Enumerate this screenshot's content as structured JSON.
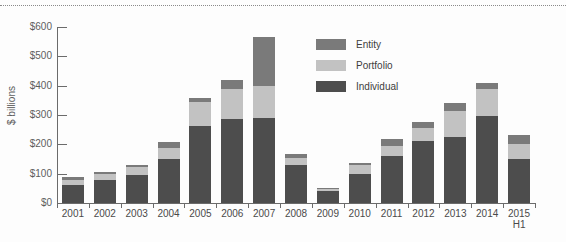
{
  "chart_data": {
    "type": "bar",
    "stacked": true,
    "title": "",
    "xlabel": "",
    "ylabel": "$ billions",
    "ylim": [
      0,
      600
    ],
    "ytick_labels": [
      "$0",
      "$100",
      "$200",
      "$300",
      "$400",
      "$500",
      "$600"
    ],
    "ytick_values": [
      0,
      100,
      200,
      300,
      400,
      500,
      600
    ],
    "grid": false,
    "legend_position": "upper-center-right",
    "categories": [
      "2001",
      "2002",
      "2003",
      "2004",
      "2005",
      "2006",
      "2007",
      "2008",
      "2009",
      "2010",
      "2011",
      "2012",
      "2013",
      "2014",
      "2015\nH1"
    ],
    "category_labels": [
      {
        "line1": "2001",
        "line2": ""
      },
      {
        "line1": "2002",
        "line2": ""
      },
      {
        "line1": "2003",
        "line2": ""
      },
      {
        "line1": "2004",
        "line2": ""
      },
      {
        "line1": "2005",
        "line2": ""
      },
      {
        "line1": "2006",
        "line2": ""
      },
      {
        "line1": "2007",
        "line2": ""
      },
      {
        "line1": "2008",
        "line2": ""
      },
      {
        "line1": "2009",
        "line2": ""
      },
      {
        "line1": "2010",
        "line2": ""
      },
      {
        "line1": "2011",
        "line2": ""
      },
      {
        "line1": "2012",
        "line2": ""
      },
      {
        "line1": "2013",
        "line2": ""
      },
      {
        "line1": "2014",
        "line2": ""
      },
      {
        "line1": "2015",
        "line2": "H1"
      }
    ],
    "series": [
      {
        "name": "Individual",
        "color": "#4d4d4d",
        "values": [
          62,
          78,
          97,
          150,
          263,
          288,
          290,
          128,
          40,
          100,
          160,
          210,
          225,
          295,
          150
        ]
      },
      {
        "name": "Portfolio",
        "color": "#c2c2c2",
        "values": [
          18,
          20,
          25,
          38,
          82,
          100,
          110,
          25,
          8,
          28,
          35,
          45,
          90,
          95,
          50
        ]
      },
      {
        "name": "Entity",
        "color": "#7a7a7a",
        "values": [
          8,
          8,
          8,
          20,
          13,
          30,
          165,
          15,
          3,
          7,
          22,
          22,
          25,
          20,
          32
        ]
      }
    ],
    "totals": [
      88,
      106,
      130,
      208,
      358,
      418,
      565,
      168,
      51,
      135,
      217,
      277,
      340,
      410,
      232
    ],
    "legend": [
      {
        "label": "Entity",
        "color": "#7a7a7a"
      },
      {
        "label": "Portfolio",
        "color": "#c2c2c2"
      },
      {
        "label": "Individual",
        "color": "#4d4d4d"
      }
    ]
  }
}
